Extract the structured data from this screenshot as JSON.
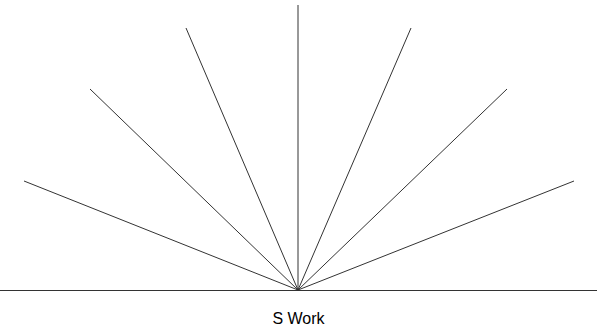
{
  "diagram": {
    "type": "fan-of-rays",
    "origin": {
      "x": 298,
      "y": 290
    },
    "baseline": {
      "x1": 0,
      "x2": 597,
      "y": 290
    },
    "rays": [
      {
        "x2": 24,
        "y2": 181
      },
      {
        "x2": 90,
        "y2": 89
      },
      {
        "x2": 186,
        "y2": 28
      },
      {
        "x2": 298,
        "y2": 5
      },
      {
        "x2": 411,
        "y2": 28
      },
      {
        "x2": 507,
        "y2": 89
      },
      {
        "x2": 574,
        "y2": 181
      }
    ],
    "line_color": "#333333",
    "bottom_label": "S Work"
  }
}
